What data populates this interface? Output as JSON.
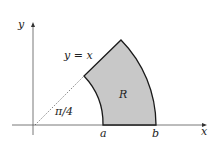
{
  "diagram": {
    "axes": {
      "x_label": "x",
      "y_label": "y"
    },
    "line_label": "y = x",
    "angle_label": "π/4",
    "region_label": "R",
    "inner_radius_label": "a",
    "outer_radius_label": "b",
    "colors": {
      "region_fill": "#c8c8c8",
      "stroke": "#1a1a1a",
      "axis": "#555555"
    }
  }
}
